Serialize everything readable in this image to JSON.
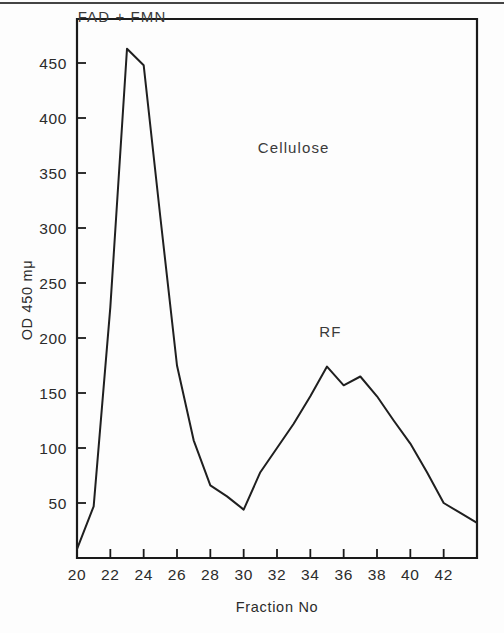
{
  "figure": {
    "background_color": "#fdfdfd",
    "ink_color": "#1f1f1f",
    "top_rule_color": "#2a2a2a"
  },
  "chart_data": {
    "type": "line",
    "title": "",
    "subtitle": "",
    "xlabel": "Fraction No",
    "ylabel": "OD 450 mμ",
    "xlim": [
      20,
      44
    ],
    "ylim": [
      0,
      490
    ],
    "grid": false,
    "legend": "none",
    "x_ticks": [
      20,
      22,
      24,
      26,
      28,
      30,
      32,
      34,
      36,
      38,
      40,
      42
    ],
    "x_tick_labels": [
      "20",
      "22",
      "24",
      "26",
      "28",
      "30",
      "32",
      "34",
      "36",
      "38",
      "40",
      "42"
    ],
    "y_ticks": [
      50,
      100,
      150,
      200,
      250,
      300,
      350,
      400,
      450
    ],
    "y_tick_labels": [
      "50",
      "100",
      "150",
      "200",
      "250",
      "300",
      "350",
      "400",
      "450"
    ],
    "series": [
      {
        "name": "OD 450 mμ",
        "color": "#1f1f1f",
        "x": [
          20,
          21,
          22,
          23,
          24,
          25,
          26,
          27,
          28,
          29,
          30,
          31,
          32,
          33,
          34,
          35,
          36,
          37,
          38,
          39,
          40,
          41,
          42,
          43,
          44
        ],
        "values": [
          8,
          47,
          228,
          463,
          448,
          310,
          175,
          107,
          66,
          56,
          44,
          78,
          100,
          122,
          147,
          174,
          157,
          165,
          147,
          125,
          104,
          78,
          50,
          41,
          32
        ]
      }
    ],
    "annotations": [
      {
        "text": "FAD + FMN",
        "x": 22.7,
        "y": 487,
        "name": "fad-fmn-label"
      },
      {
        "text": "Cellulose",
        "x": 33.0,
        "y": 368,
        "name": "cellulose-label"
      },
      {
        "text": "RF",
        "x": 35.2,
        "y": 201,
        "name": "rf-label"
      }
    ]
  }
}
